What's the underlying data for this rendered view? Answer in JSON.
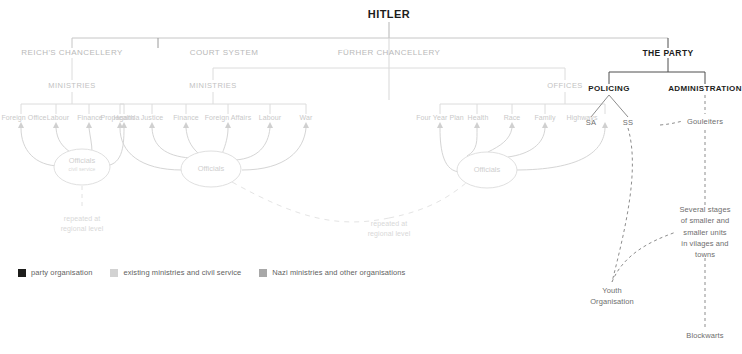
{
  "chart_data": {
    "type": "diagram",
    "title": "HITLER",
    "subtype": "organisational-hierarchy-chart"
  },
  "root": {
    "label": "HITLER"
  },
  "level1": [
    {
      "id": "reichs-chancellery",
      "label": "REICH'S CHANCELLERY"
    },
    {
      "id": "court-system",
      "label": "COURT SYSTEM"
    },
    {
      "id": "furher-chancellery",
      "label": "FÜRHER CHANCELLERY"
    },
    {
      "id": "the-party",
      "label": "THE PARTY"
    }
  ],
  "groups": {
    "reich_ministries": {
      "label": "MINISTRIES"
    },
    "furher_ministries": {
      "label": "MINISTRIES"
    },
    "furher_offices": {
      "label": "OFFICES"
    }
  },
  "reich_ministries_items": [
    {
      "label": "Foreign Office"
    },
    {
      "label": "Labour"
    },
    {
      "label": "Finance"
    },
    {
      "label": "Health"
    }
  ],
  "furher_ministries_items": [
    {
      "label": "Propaganda"
    },
    {
      "label": "Justice"
    },
    {
      "label": "Finance"
    },
    {
      "label": "Foreign Affairs"
    },
    {
      "label": "Labour"
    },
    {
      "label": "War"
    }
  ],
  "furher_offices_items": [
    {
      "label": "Four Year Plan"
    },
    {
      "label": "Health"
    },
    {
      "label": "Race"
    },
    {
      "label": "Family"
    },
    {
      "label": "Highways"
    }
  ],
  "officials": {
    "reich": {
      "label": "Officials",
      "sub": "civil service"
    },
    "ministries": {
      "label": "Officials",
      "sub": ""
    },
    "offices": {
      "label": "Officials",
      "sub": ""
    }
  },
  "notes": {
    "left_repeated": "repeated at\nregional level",
    "right_repeated": "repeated at\nregional level"
  },
  "party": {
    "policing": {
      "label": "POLICING"
    },
    "administration": {
      "label": "ADMINISTRATION"
    },
    "sa": {
      "label": "SA"
    },
    "ss": {
      "label": "SS"
    },
    "gouleiters": {
      "label": "Gouleiters"
    },
    "youth": {
      "label": "Youth\nOrganisation"
    },
    "stages": {
      "label": "Several stages\nof smaller and\nsmaller units\nin vilages and\ntowns"
    },
    "blockwarts": {
      "label": "Blockwarts"
    }
  },
  "legend": [
    {
      "label": "party organisation",
      "color": "#1d1d1b"
    },
    {
      "label": "existing ministries and civil service",
      "color": "#d2d2d2"
    },
    {
      "label": "Nazi ministries and other organisations",
      "color": "#a8a8a8"
    }
  ],
  "colors": {
    "dark": "#1d1d1b",
    "line_light": "#dcdcdc",
    "line_mid": "#c9c9c9",
    "line_dark": "#555555",
    "text_light": "#c9c9c9"
  },
  "caption": ""
}
